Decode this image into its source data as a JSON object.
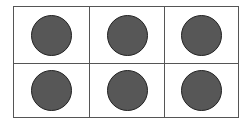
{
  "diagram": {
    "type": "ten-frame-style grid",
    "rows": 2,
    "columns": 3,
    "cells": [
      {
        "row": 0,
        "col": 0,
        "filled": true
      },
      {
        "row": 0,
        "col": 1,
        "filled": true
      },
      {
        "row": 0,
        "col": 2,
        "filled": true
      },
      {
        "row": 1,
        "col": 0,
        "filled": true
      },
      {
        "row": 1,
        "col": 1,
        "filled": true
      },
      {
        "row": 1,
        "col": 2,
        "filled": true
      }
    ],
    "counter_count": 6,
    "colors": {
      "counter_fill": "#575757",
      "counter_stroke": "#222222",
      "grid_line": "#555555",
      "background": "#ffffff"
    }
  }
}
